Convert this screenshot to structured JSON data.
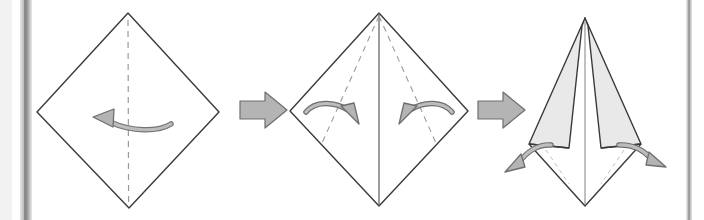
{
  "figure": {
    "kind": "origami-fold-instruction-diagram",
    "orientation": "horizontal-sequence",
    "step_count": 3,
    "background_color": "#ffffff",
    "ink_color": "#4a4a4a",
    "outline_color": "#3a3a3a",
    "fold_line_color": "#8a8a8a",
    "arrow_fill_color": "#b0b0b0",
    "arrow_stroke_color": "#6e6e6e",
    "shaded_face_color": "#e9e9e9",
    "page_edge_color": "#9a9a9a"
  },
  "page_edges": {
    "left": {
      "label": "left-page-edge",
      "x": 22,
      "width": 9,
      "color": "#8f8f8f",
      "shadow_color": "#cfcfcf"
    },
    "right": {
      "label": "right-page-edge",
      "x": 688,
      "width": 4,
      "color": "#a5a5a5",
      "shadow_color": "#d8d8d8"
    }
  },
  "steps": [
    {
      "index": 1,
      "name": "square-base-diamond",
      "description": "Square sheet rotated 45 degrees with vertical mountain crease and fold-left arrow",
      "shape": {
        "type": "diamond",
        "top": [
          128,
          13
        ],
        "left": [
          37,
          112
        ],
        "right": [
          219,
          112
        ],
        "bottom": [
          129,
          208
        ],
        "fill": "#ffffff",
        "stroke": "#3a3a3a"
      },
      "crease_lines": [
        {
          "name": "vertical-center-crease",
          "style": "dashed",
          "from": [
            128,
            20
          ],
          "to": [
            128,
            202
          ]
        }
      ],
      "motion_arrows": [
        {
          "name": "fold-left-arrow",
          "style": "curved",
          "direction": "left",
          "from": [
            163,
            122
          ],
          "to": [
            93,
            119
          ]
        }
      ]
    },
    {
      "index": 2,
      "name": "petal-fold-preparation",
      "description": "Diamond with center mountain fold and two dashed valley creases, arrows folding both side flaps inward",
      "shape": {
        "type": "diamond",
        "top": [
          379,
          13
        ],
        "left": [
          290,
          111
        ],
        "right": [
          468,
          111
        ],
        "bottom": [
          379,
          206
        ],
        "fill": "#ffffff",
        "stroke": "#3a3a3a"
      },
      "crease_lines": [
        {
          "name": "vertical-center-fold",
          "style": "solid",
          "from": [
            379,
            13
          ],
          "to": [
            379,
            206
          ]
        },
        {
          "name": "left-diagonal-crease",
          "style": "dashed",
          "from": [
            379,
            15
          ],
          "to": [
            323,
            142
          ]
        },
        {
          "name": "right-diagonal-crease",
          "style": "dashed",
          "from": [
            379,
            15
          ],
          "to": [
            435,
            142
          ]
        }
      ],
      "motion_arrows": [
        {
          "name": "fold-right-inward-arrow",
          "style": "curved",
          "direction": "right",
          "from": [
            306,
            111
          ],
          "to": [
            352,
            122
          ]
        },
        {
          "name": "fold-left-inward-arrow",
          "style": "curved",
          "direction": "left",
          "from": [
            452,
            111
          ],
          "to": [
            406,
            122
          ]
        }
      ]
    },
    {
      "index": 3,
      "name": "kite-with-open-flaps",
      "description": "Narrow kite form with two shaded triangular flaps opening outward",
      "shape": {
        "type": "kite",
        "top": [
          585,
          18
        ],
        "bottom": [
          585,
          206
        ],
        "left_wing": [
          529,
          144
        ],
        "right_wing": [
          641,
          144
        ],
        "fill": "#ffffff",
        "stroke": "#3a3a3a"
      },
      "shaded_faces": [
        {
          "name": "left-shaded-flap",
          "fill": "#e9e9e9",
          "points": "585,18 529,144 568,148 582,25"
        },
        {
          "name": "right-shaded-flap",
          "fill": "#e9e9e9",
          "points": "585,18 641,144 602,148 588,25"
        }
      ],
      "crease_lines": [
        {
          "name": "vertical-center-line",
          "style": "solid-thin",
          "from": [
            585,
            22
          ],
          "to": [
            585,
            204
          ]
        },
        {
          "name": "left-hidden-crease",
          "style": "dashed-faint",
          "from": [
            545,
            148
          ],
          "to": [
            568,
            182
          ]
        },
        {
          "name": "right-hidden-crease",
          "style": "dashed-faint",
          "from": [
            625,
            148
          ],
          "to": [
            602,
            182
          ]
        }
      ],
      "motion_arrows": [
        {
          "name": "open-left-flap-arrow",
          "style": "curved",
          "direction": "down-left",
          "from": [
            545,
            144
          ],
          "to": [
            513,
            169
          ]
        },
        {
          "name": "open-right-flap-arrow",
          "style": "curved",
          "direction": "down-right",
          "from": [
            625,
            144
          ],
          "to": [
            659,
            162
          ]
        }
      ]
    }
  ],
  "step_arrows": [
    {
      "name": "step-arrow-1-to-2",
      "direction": "right",
      "x": 240,
      "y": 110,
      "length": 46,
      "fill": "#b4b4b4",
      "stroke": "#6e6e6e"
    },
    {
      "name": "step-arrow-2-to-3",
      "direction": "right",
      "x": 478,
      "y": 110,
      "length": 46,
      "fill": "#b4b4b4",
      "stroke": "#6e6e6e"
    }
  ]
}
